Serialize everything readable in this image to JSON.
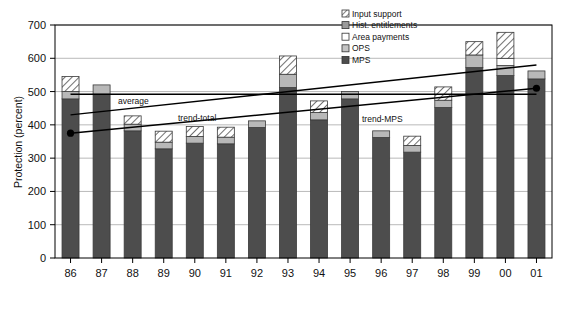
{
  "chart_data": {
    "type": "bar",
    "stacked": true,
    "title": "",
    "xlabel": "",
    "ylabel": "Protection (percent)",
    "ylim": [
      0,
      700
    ],
    "ytick_step": 100,
    "yticks": [
      0,
      100,
      200,
      300,
      400,
      500,
      600,
      700
    ],
    "grid": true,
    "legend_position": "top-right",
    "categories": [
      "86",
      "87",
      "88",
      "89",
      "90",
      "91",
      "92",
      "93",
      "94",
      "95",
      "96",
      "97",
      "98",
      "99",
      "00",
      "01"
    ],
    "series": [
      {
        "name": "MPS",
        "key": "mps",
        "fill": "#4d4d4d",
        "pattern": "solid-dark",
        "values": [
          478,
          492,
          382,
          328,
          345,
          343,
          392,
          512,
          415,
          478,
          362,
          318,
          452,
          572,
          548,
          538
        ]
      },
      {
        "name": "OPS",
        "key": "ops",
        "fill": "#b8b8b8",
        "pattern": "light-gray",
        "values": [
          22,
          28,
          20,
          20,
          20,
          20,
          20,
          40,
          22,
          22,
          20,
          20,
          22,
          38,
          30,
          24
        ]
      },
      {
        "name": "Area payments",
        "key": "area",
        "fill": "#ffffff",
        "pattern": "white",
        "values": [
          0,
          0,
          0,
          0,
          0,
          0,
          0,
          0,
          0,
          0,
          0,
          0,
          0,
          0,
          22,
          0
        ]
      },
      {
        "name": "Hist. entitlements",
        "key": "hist",
        "fill": "#9a9a9a",
        "pattern": "mid-gray",
        "values": [
          0,
          0,
          0,
          0,
          0,
          0,
          0,
          0,
          0,
          0,
          0,
          0,
          0,
          0,
          0,
          0
        ]
      },
      {
        "name": "Input support",
        "key": "input",
        "fill": "#ffffff",
        "pattern": "hatch",
        "values": [
          45,
          0,
          25,
          33,
          30,
          30,
          0,
          55,
          35,
          0,
          0,
          28,
          40,
          40,
          78,
          0
        ]
      }
    ],
    "totals": [
      545,
      520,
      427,
      381,
      395,
      393,
      412,
      607,
      472,
      500,
      382,
      366,
      514,
      650,
      678,
      562
    ],
    "annotations": [
      {
        "name": "average",
        "label": "average",
        "type": "line-label",
        "line": {
          "x_start_cat": 0,
          "x_end_cat": 15,
          "y_start": 492,
          "y_end": 492
        }
      },
      {
        "name": "trend-total",
        "label": "trend-total",
        "type": "trend-line",
        "line": {
          "x_start_cat": 0,
          "x_end_cat": 15,
          "y_start": 430,
          "y_end": 580
        },
        "markers": []
      },
      {
        "name": "trend-MPS",
        "label": "trend-MPS",
        "type": "trend-line",
        "line": {
          "x_start_cat": 0,
          "x_end_cat": 15,
          "y_start": 375,
          "y_end": 510
        },
        "markers": [
          "start",
          "end"
        ]
      }
    ]
  },
  "legend": {
    "items": [
      {
        "label": "Input support",
        "swatch": "hatch-swatch"
      },
      {
        "label": "Hist. entitlements",
        "swatch": "mid-gray-swatch"
      },
      {
        "label": "Area payments",
        "swatch": "white-swatch"
      },
      {
        "label": "OPS",
        "swatch": "light-gray-swatch"
      },
      {
        "label": "MPS",
        "swatch": "dark-gray-swatch"
      }
    ]
  },
  "axes": {
    "y_title": "Protection (percent)",
    "y_ticks": [
      "0",
      "100",
      "200",
      "300",
      "400",
      "500",
      "600",
      "700"
    ],
    "x_ticks": [
      "86",
      "87",
      "88",
      "89",
      "90",
      "91",
      "92",
      "93",
      "94",
      "95",
      "96",
      "97",
      "98",
      "99",
      "00",
      "01"
    ]
  },
  "colors": {
    "mps": "#4d4d4d",
    "ops": "#b8b8b8",
    "area_payments": "#ffffff",
    "hist_entitlements": "#9a9a9a",
    "input_support": "#ffffff",
    "grid": "#9a9a9a",
    "axis": "#000000",
    "trend": "#000000"
  }
}
